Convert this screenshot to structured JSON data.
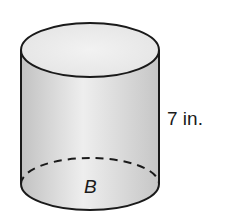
{
  "figure": {
    "shape": "cylinder",
    "height_label": "7 in.",
    "base_label": "B"
  },
  "colors": {
    "outline": "#1a1a1a",
    "side_edge": "#c4c4c4",
    "side_center": "#ededed",
    "top_face": "#ebebeb",
    "background": "#ffffff"
  }
}
